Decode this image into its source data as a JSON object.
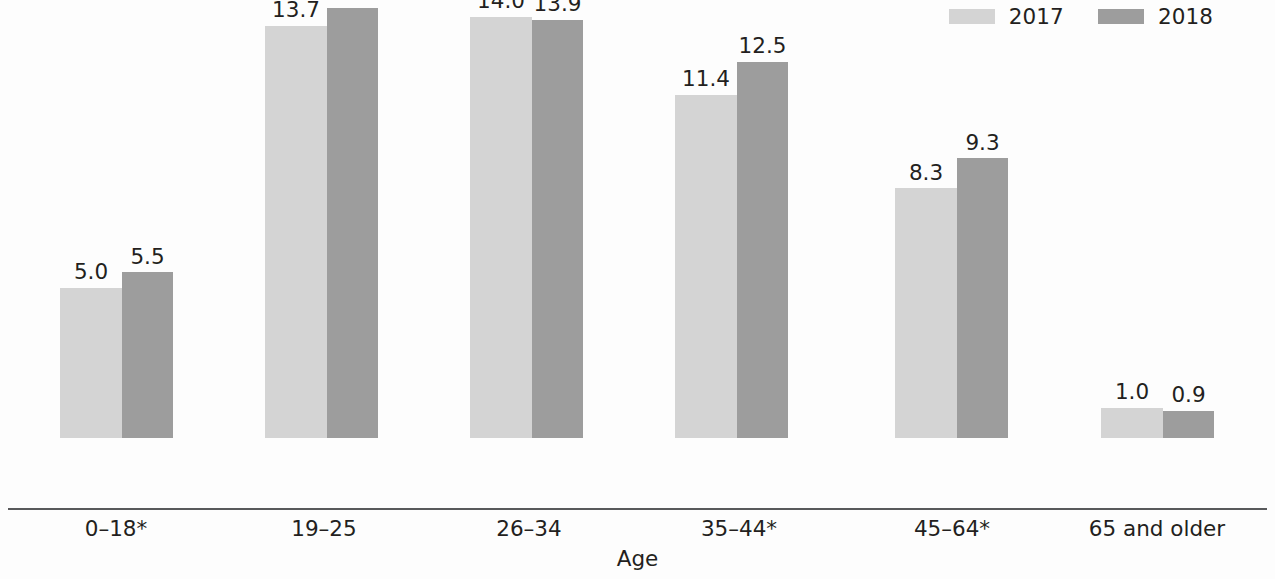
{
  "chart_data": {
    "type": "bar",
    "title": "",
    "subtitle": "",
    "xlabel": "Age",
    "ylabel": "",
    "ylim": [
      0,
      16
    ],
    "grid": false,
    "legend_position": "top-right",
    "categories": [
      "0–18*",
      "19–25",
      "26–34",
      "35–44*",
      "45–64*",
      "65 and older"
    ],
    "series": [
      {
        "name": "2017",
        "color": "#d4d4d4",
        "values": [
          5.0,
          13.7,
          14.0,
          11.4,
          8.3,
          1.0
        ],
        "labels": [
          "5.0",
          "13.7",
          "14.0",
          "11.4",
          "8.3",
          "1.0"
        ]
      },
      {
        "name": "2018",
        "color": "#9d9d9d",
        "values": [
          5.5,
          14.3,
          13.9,
          12.5,
          9.3,
          0.9
        ],
        "labels": [
          "5.5",
          "14.3",
          "13.9",
          "12.5",
          "9.3",
          "0.9"
        ]
      }
    ],
    "annotations": []
  },
  "legend": {
    "items": [
      {
        "label": "2017",
        "color": "#d4d4d4",
        "swatch_name": "legend-swatch-2017"
      },
      {
        "label": "2018",
        "color": "#9d9d9d",
        "swatch_name": "legend-swatch-2018"
      }
    ]
  },
  "axis": {
    "x_title": "Age",
    "tick_labels": [
      "0–18*",
      "19–25",
      "26–34",
      "35–44*",
      "45–64*",
      "65 and older"
    ],
    "line_color": "#58595b"
  },
  "layout": {
    "baseline_y": 508,
    "px_per_unit": 30.1,
    "bar_width_light": 62,
    "bar_width_dark": 51,
    "group_left_positions": [
      60,
      265,
      470,
      675,
      895,
      1101
    ],
    "tick_centers": [
      116,
      324,
      529,
      739,
      952,
      1157
    ]
  },
  "colors": {
    "background": "#fdfdfd",
    "text": "#231f20",
    "series_2017": "#d4d4d4",
    "series_2018": "#9d9d9d",
    "axis": "#58595b"
  }
}
